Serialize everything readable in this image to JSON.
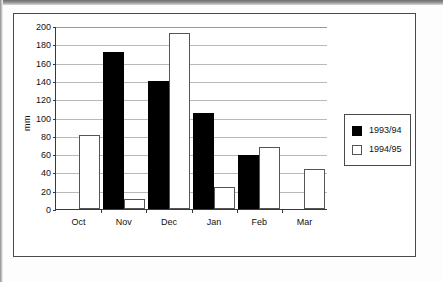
{
  "figure": {
    "axis_title": "mm"
  },
  "legend": {
    "entries": [
      {
        "label": "1993/94",
        "swatch": "black-filled-square"
      },
      {
        "label": "1994/95",
        "swatch": "white-outlined-square"
      }
    ]
  },
  "chart_data": {
    "type": "bar",
    "title": "",
    "xlabel": "",
    "ylabel": "mm",
    "ylim": [
      0,
      200
    ],
    "ytick_step": 20,
    "yticks": [
      0,
      20,
      40,
      60,
      80,
      100,
      120,
      140,
      160,
      180,
      200
    ],
    "ytick_labels": [
      "0",
      "20",
      "40",
      "60",
      "80",
      "100",
      "120",
      "140",
      "160",
      "180",
      "200"
    ],
    "grid": "horizontal",
    "legend_position": "right",
    "categories": [
      "Oct",
      "Nov",
      "Dec",
      "Jan",
      "Feb",
      "Mar"
    ],
    "series": [
      {
        "name": "1993/94",
        "color": "#000000",
        "values": [
          0,
          172,
          140,
          105,
          59,
          0
        ]
      },
      {
        "name": "1994/95",
        "color": "#ffffff",
        "values": [
          81,
          11,
          192,
          24,
          68,
          44
        ]
      }
    ]
  }
}
